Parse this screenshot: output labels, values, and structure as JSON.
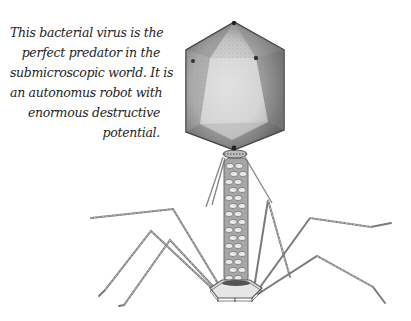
{
  "caption": {
    "lines": [
      "This bacterial virus is the",
      "perfect predator in the",
      "submicroscopic world. It is",
      "an autonomus robot with",
      "enormous destructive",
      "potential."
    ]
  },
  "illustration": {
    "subject": "bacteriophage",
    "parts": [
      "capsid-head",
      "collar",
      "tail-sheath",
      "baseplate",
      "tail-fibers",
      "whiskers"
    ],
    "colors": {
      "capsid_dark": "#5a5a5a",
      "capsid_light": "#d8d8d8",
      "line": "#6e6e6e",
      "sheath": "#9a9a9a"
    }
  }
}
